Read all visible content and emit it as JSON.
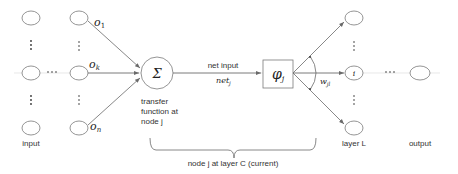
{
  "diagram": {
    "type": "neural-network-node",
    "labels": {
      "input": "input",
      "layer_l": "layer L",
      "output": "output",
      "transfer_line1": "transfer",
      "transfer_line2": "function at",
      "transfer_line3": "node j",
      "net_input": "net input",
      "net_symbol": "net",
      "net_sub": "j",
      "brace_caption": "node j at layer C (current)"
    },
    "symbols": {
      "o1": "o",
      "o1_sub": "1",
      "ok": "o",
      "ok_sub": "k",
      "on": "o",
      "on_sub": "n",
      "sum": "Σ",
      "phi": "φ",
      "phi_sub": "j",
      "weight": "w",
      "weight_sub": "jl",
      "target_node": "i",
      "ellipsis": "···",
      "vdots": "⋮"
    },
    "colors": {
      "stroke": "#7a7a7a",
      "edge": "#6a6a6a",
      "text": "#333333"
    }
  }
}
